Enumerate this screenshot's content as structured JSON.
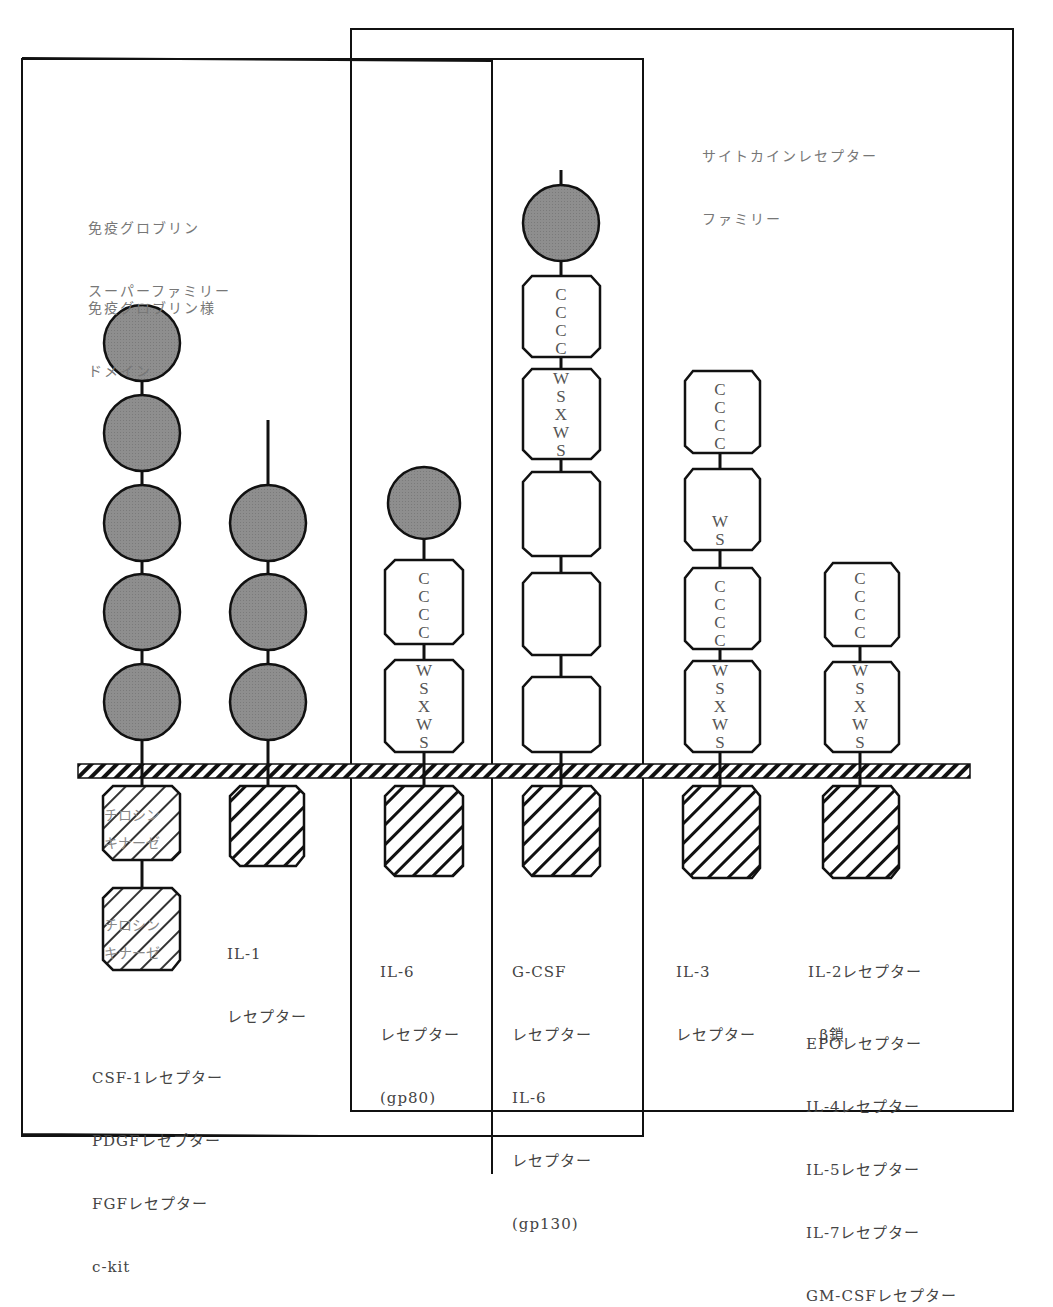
{
  "groups": {
    "immunoglobulin_superfamily": {
      "title_lines": [
        "免疫グロブリン",
        "スーパーファミリー"
      ],
      "domain_legend_lines": [
        "免疫グロブリン様",
        "ドメイン"
      ]
    },
    "cytokine_receptor_family": {
      "title_lines": [
        "サイトカインレセプター",
        "ファミリー"
      ]
    }
  },
  "domain_codes": {
    "cccc": [
      "C",
      "C",
      "C",
      "C"
    ],
    "wsxws": [
      "W",
      "S",
      "X",
      "W",
      "S"
    ],
    "ws": [
      "W",
      "S"
    ]
  },
  "tyrosine_kinase_label": [
    "チロシン",
    "キナーゼ"
  ],
  "receptors": [
    {
      "id": "csf1",
      "extracellular": [
        "ig",
        "ig",
        "ig",
        "ig",
        "ig"
      ],
      "intracellular": [
        "tyrosine-kinase",
        "tyrosine-kinase"
      ],
      "label_lines": [
        "CSF-1レセプター",
        "PDGFレセプター",
        "FGFレセプター",
        "c-kit"
      ]
    },
    {
      "id": "il1",
      "extracellular": [
        "ig",
        "ig",
        "ig"
      ],
      "intracellular": [
        "cytoplasmic"
      ],
      "label_lines": [
        "IL-1",
        "レセプター"
      ]
    },
    {
      "id": "il6-gp80",
      "extracellular": [
        "ig",
        "CCCC",
        "WSXWS"
      ],
      "intracellular": [
        "cytoplasmic"
      ],
      "label_lines": [
        "IL-6",
        "レセプター",
        "(gp80)"
      ]
    },
    {
      "id": "gcsf-gp130",
      "extracellular": [
        "ig",
        "CCCC",
        "WSXWS",
        "blank",
        "blank",
        "blank"
      ],
      "intracellular": [
        "cytoplasmic"
      ],
      "label_lines": [
        "G-CSF",
        "レセプター",
        "IL-6",
        "レセプター",
        "(gp130)"
      ]
    },
    {
      "id": "il3",
      "extracellular": [
        "CCCC",
        "WS",
        "CCCC",
        "WSXWS"
      ],
      "intracellular": [
        "cytoplasmic"
      ],
      "label_lines": [
        "IL-3",
        "レセプター"
      ]
    },
    {
      "id": "il2-beta",
      "extracellular": [
        "CCCC",
        "WSXWS"
      ],
      "intracellular": [
        "cytoplasmic"
      ],
      "label_lines": [
        "IL-2レセプター",
        "  β鎖"
      ],
      "also_lines": [
        "EPOレセプター",
        "IL-4レセプター",
        "IL-5レセプター",
        "IL-7レセプター",
        "GM-CSFレセプター"
      ]
    }
  ],
  "colors": {
    "ig_domain_fill": "#8c8c8c",
    "line": "#111111",
    "text": "#444444"
  }
}
